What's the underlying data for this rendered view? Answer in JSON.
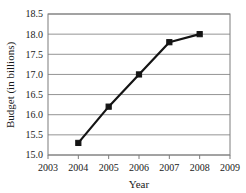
{
  "chart_data": {
    "type": "line",
    "title": "",
    "xlabel": "Year",
    "ylabel": "Budget (in billions)",
    "x": [
      2004,
      2005,
      2006,
      2007,
      2008
    ],
    "values": [
      15.3,
      16.2,
      17.0,
      17.8,
      18.0
    ],
    "series": [
      {
        "name": "Budget",
        "values": [
          15.3,
          16.2,
          17.0,
          17.8,
          18.0
        ]
      }
    ],
    "xlim": [
      2003,
      2009
    ],
    "ylim": [
      15.0,
      18.5
    ],
    "xticks": [
      2003,
      2004,
      2005,
      2006,
      2007,
      2008,
      2009
    ],
    "xtick_labels": [
      "2003",
      "2004",
      "2005",
      "2006",
      "2007",
      "2008",
      "2009"
    ],
    "yticks": [
      15.0,
      15.5,
      16.0,
      16.5,
      17.0,
      17.5,
      18.0,
      18.5
    ],
    "ytick_labels": [
      "15.0",
      "15.5",
      "16.0",
      "16.5",
      "17.0",
      "17.5",
      "18.0",
      "18.5"
    ],
    "grid": "horizontal",
    "legend": "none",
    "colors": {
      "line": "#141414",
      "marker": "#141414",
      "grid": "#949494",
      "frame": "#7d7d7d",
      "text": "#1a1a1a",
      "background": "#ffffff"
    },
    "marker_style": "square",
    "line_width": 2.2
  }
}
